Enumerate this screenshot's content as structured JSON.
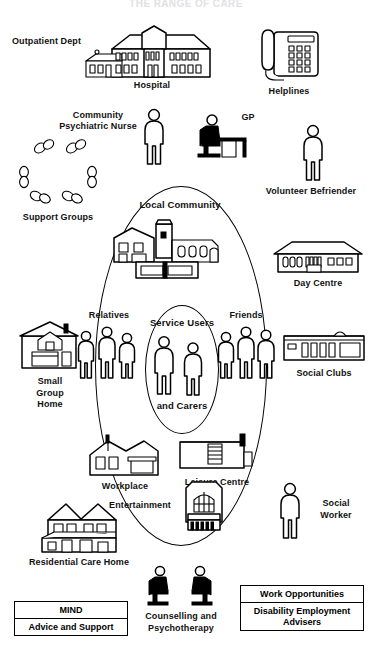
{
  "title": "THE RANGE OF CARE",
  "diagram": {
    "type": "concentric-circles-of-support",
    "core": {
      "label_top": "Service Users",
      "label_bottom": "and Carers",
      "figure_count": 2
    },
    "inner_ring": [
      {
        "label": "Relatives",
        "icon": "people-group-icon",
        "figure_count": 3
      },
      {
        "label": "Friends",
        "icon": "people-group-icon",
        "figure_count": 3
      }
    ],
    "outer_ring": [
      {
        "label": "Local Community",
        "icon": "church-and-shops-icon"
      },
      {
        "label": "Workplace",
        "icon": "workplace-building-icon"
      },
      {
        "label": "Leisure Centre",
        "icon": "leisure-centre-icon"
      },
      {
        "label": "Entertainment",
        "icon": "theatre-building-icon"
      }
    ],
    "external_services": [
      {
        "label": "Outpatient Dept",
        "icon": "outpatient-wing-icon"
      },
      {
        "label": "Hospital",
        "icon": "hospital-building-icon"
      },
      {
        "label": "Helplines",
        "icon": "telephone-icon"
      },
      {
        "label": "Community\nPsychiatric Nurse",
        "icon": "standing-person-icon"
      },
      {
        "label": "GP",
        "icon": "seated-person-at-desk-icon"
      },
      {
        "label": "Volunteer Befriender",
        "icon": "standing-person-icon"
      },
      {
        "label": "Support Groups",
        "icon": "circle-of-people-icon"
      },
      {
        "label": "Day Centre",
        "icon": "day-centre-building-icon"
      },
      {
        "label": "Small\nGroup\nHome",
        "icon": "small-house-icon"
      },
      {
        "label": "Social Clubs",
        "icon": "social-club-building-icon"
      },
      {
        "label": "Social\nWorker",
        "icon": "standing-person-icon"
      },
      {
        "label": "Residential Care Home",
        "icon": "twin-gabled-house-icon"
      },
      {
        "label": "Counselling and\nPsychotherapy",
        "icon": "two-seated-people-icon"
      }
    ],
    "boxes": [
      {
        "name": "mind-box",
        "rows": [
          "MIND",
          "Advice and Support"
        ]
      },
      {
        "name": "employment-box",
        "rows": [
          "Work Opportunities",
          "Disability Employment\nAdvisers"
        ]
      }
    ]
  }
}
